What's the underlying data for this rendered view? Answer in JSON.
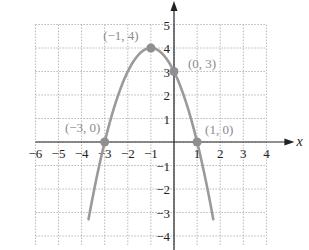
{
  "chart_data": {
    "type": "line",
    "title": "",
    "xlabel": "x",
    "ylabel": "",
    "xlim": [
      -6,
      4
    ],
    "ylim": [
      -4,
      5
    ],
    "grid": true,
    "x_ticks": [
      "−6",
      "−5",
      "−4",
      "−3",
      "−2",
      "−1",
      "1",
      "2",
      "3",
      "4"
    ],
    "y_ticks": [
      "5",
      "4",
      "3",
      "2",
      "1",
      "−1",
      "−2",
      "−3",
      "−4"
    ],
    "series": [
      {
        "name": "y = -x^2 - 2x + 3",
        "equation": "y = -(x+1)^2 + 4",
        "color": "#9a9a9a",
        "x": [
          -3.6,
          -3,
          -2,
          -1,
          0,
          1,
          1.6
        ],
        "y": [
          -2.76,
          0,
          3,
          4,
          3,
          0,
          -2.76
        ]
      }
    ],
    "points": [
      {
        "label": "(−1, 4)",
        "x": -1,
        "y": 4
      },
      {
        "label": "(0, 3)",
        "x": 0,
        "y": 3
      },
      {
        "label": "(−3, 0)",
        "x": -3,
        "y": 0
      },
      {
        "label": "(1, 0)",
        "x": 1,
        "y": 0
      }
    ],
    "colors": {
      "curve": "#9a9a9a",
      "point": "#8f8f8f",
      "grid": "#b8b8b8",
      "axis": "#222222"
    }
  }
}
